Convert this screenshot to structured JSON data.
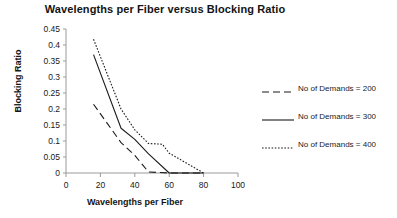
{
  "chart_data": {
    "type": "line",
    "title": "Wavelengths per Fiber versus Blocking Ratio",
    "xlabel": "Wavelengths per Fiber",
    "ylabel": "Blocking Ratio",
    "xlim": [
      0,
      100
    ],
    "ylim": [
      0,
      0.45
    ],
    "xticks": [
      0,
      20,
      40,
      60,
      80,
      100
    ],
    "xtick_labels": [
      "0",
      "20",
      "40",
      "60",
      "80",
      "100"
    ],
    "yticks": [
      0,
      0.05,
      0.1,
      0.15,
      0.2,
      0.25,
      0.3,
      0.35,
      0.4,
      0.45
    ],
    "ytick_labels": [
      "0",
      "0.05",
      "0.1",
      "0.15",
      "0.2",
      "0.25",
      "0.3",
      "0.35",
      "0.4",
      "0.45"
    ],
    "grid": false,
    "legend_position": "right",
    "line_color": "#1a1a1a",
    "series": [
      {
        "name": "No of Demands = 200",
        "style": "dashed",
        "x": [
          16,
          32,
          40,
          48,
          60,
          80
        ],
        "values": [
          0.215,
          0.095,
          0.055,
          0.003,
          0.0,
          0.0
        ]
      },
      {
        "name": "No of Demands = 300",
        "style": "solid",
        "x": [
          16,
          32,
          40,
          48,
          60,
          80
        ],
        "values": [
          0.37,
          0.14,
          0.105,
          0.06,
          0.0,
          0.0
        ]
      },
      {
        "name": "No of Demands = 400",
        "style": "dotted",
        "x": [
          16,
          32,
          40,
          48,
          56,
          60,
          80
        ],
        "values": [
          0.418,
          0.2,
          0.135,
          0.092,
          0.09,
          0.062,
          0.0
        ]
      }
    ]
  },
  "legend": {
    "entries": [
      {
        "label": "No of Demands = 200",
        "style": "dashed"
      },
      {
        "label": "No of Demands = 300",
        "style": "solid"
      },
      {
        "label": "No of Demands = 400",
        "style": "dotted"
      }
    ]
  }
}
